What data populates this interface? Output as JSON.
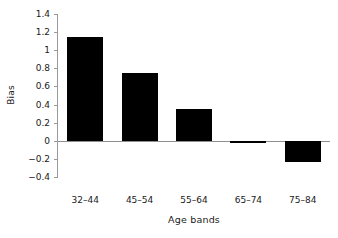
{
  "chart_data": {
    "type": "bar",
    "title": "",
    "subtitle": "",
    "xlabel": "Age bands",
    "ylabel": "Bias",
    "categories": [
      "32–44",
      "45–54",
      "55–64",
      "65–74",
      "75–84"
    ],
    "values": [
      1.15,
      0.75,
      0.35,
      -0.02,
      -0.23
    ],
    "series": [
      {
        "name": "Bias",
        "values": [
          1.15,
          0.75,
          0.35,
          -0.02,
          -0.23
        ]
      }
    ],
    "ylim": [
      -0.4,
      1.4
    ],
    "ytick_values": [
      1.4,
      1.2,
      1,
      0.8,
      0.6,
      0.4,
      0.2,
      0,
      -0.2,
      -0.4
    ],
    "ytick_labels": [
      "1.4",
      "1.2",
      "1",
      "0.8",
      "0.6",
      "0.4",
      "0.2",
      "0",
      "−0.2",
      "−0.4"
    ],
    "grid": false,
    "legend": false,
    "legend_position": "none",
    "bar_color": "#000000",
    "axis_color": "#9a9a9a",
    "background_color": "#ffffff",
    "zero_line": true,
    "annotations": []
  }
}
